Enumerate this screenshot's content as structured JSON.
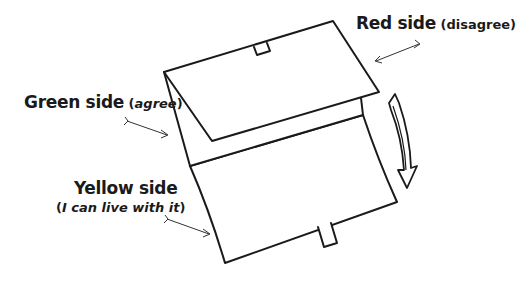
{
  "labels": {
    "red": {
      "title": "Red side",
      "paren_open": " (",
      "qualifier": "disagree",
      "paren_close": ")"
    },
    "green": {
      "title": "Green side",
      "paren_open": " (",
      "qualifier": "agree",
      "paren_close": ")"
    },
    "yellow": {
      "title": "Yellow side",
      "paren_open": "(",
      "qualifier": "I can live with it",
      "paren_close": ")"
    }
  },
  "colors": {
    "stroke": "#1a1a1a",
    "background": "#ffffff"
  }
}
